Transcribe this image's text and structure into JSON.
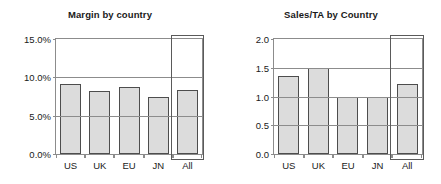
{
  "chart_data": [
    {
      "type": "bar",
      "title": "Margin by country",
      "xlabel": "",
      "ylabel": "",
      "categories": [
        "US",
        "UK",
        "EU",
        "JN",
        "All"
      ],
      "values": [
        9.1,
        8.2,
        8.7,
        7.5,
        8.4
      ],
      "value_format": "percent",
      "ylim": [
        0.0,
        15.0
      ],
      "yticks": [
        0.0,
        5.0,
        10.0,
        15.0
      ],
      "ytick_labels": [
        "0.0%",
        "5.0%",
        "10.0%",
        "15.0%"
      ],
      "grid": true,
      "legend": "none",
      "annotations": [
        {
          "name": "all-highlight-box",
          "category": "All",
          "description": "rectangle outlining the All column"
        }
      ],
      "colors": {
        "bar_fill": "#dcdcdc",
        "bar_border": "#4d4d4d",
        "axis": "#8c8c8c",
        "text": "#1a1a1a",
        "background": "#ffffff"
      }
    },
    {
      "type": "bar",
      "title": "Sales/TA by Country",
      "xlabel": "",
      "ylabel": "",
      "categories": [
        "US",
        "UK",
        "EU",
        "JN",
        "All"
      ],
      "values": [
        1.35,
        1.5,
        1.0,
        1.0,
        1.22
      ],
      "value_format": "number",
      "ylim": [
        0.0,
        2.0
      ],
      "yticks": [
        0.0,
        0.5,
        1.0,
        1.5,
        2.0
      ],
      "ytick_labels": [
        "0.0",
        "0.5",
        "1.0",
        "1.5",
        "2.0"
      ],
      "grid": true,
      "legend": "none",
      "annotations": [
        {
          "name": "all-highlight-box",
          "category": "All",
          "description": "rectangle outlining the All column"
        }
      ],
      "colors": {
        "bar_fill": "#dcdcdc",
        "bar_border": "#4d4d4d",
        "axis": "#8c8c8c",
        "text": "#1a1a1a",
        "background": "#ffffff"
      }
    }
  ]
}
